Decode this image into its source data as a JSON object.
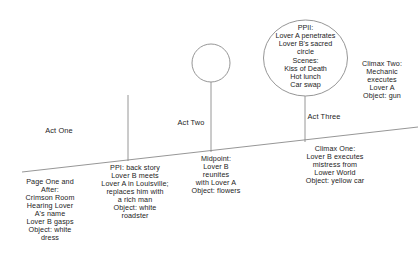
{
  "diagram": {
    "type": "story-structure-beat-sheet",
    "stroke_color": "#8a8a8a",
    "text_color": "#1c1c1c",
    "act_labels": [
      {
        "id": "act-one",
        "text": "Act One"
      },
      {
        "id": "act-two",
        "text": "Act Two"
      },
      {
        "id": "act-three",
        "text": "Act Three"
      }
    ],
    "nodes": {
      "ppii": {
        "shape": "ellipse",
        "text": "PPII:\nLover A penetrates\nLover B's sacred\ncircle\nScenes:\nKiss of Death\nHot lunch\nCar swap"
      },
      "midpoint_circle": {
        "shape": "circle",
        "text": ""
      }
    },
    "beats": [
      {
        "id": "page-one-and-after",
        "text": "Page One and\nAfter:\nCrimson Room\nHearing Lover\nA's name\nLover B gasps\nObject: white\ndress"
      },
      {
        "id": "ppi",
        "text": "PPI: back story\nLover B meets\nLover A in Louisville;\nreplaces him with\na rich man\nObject: white\nroadster"
      },
      {
        "id": "midpoint",
        "text": "Midpoint:\nLover B\nreunites\nwith Lover A\nObject: flowers"
      },
      {
        "id": "climax-one",
        "text": "Climax One:\nLover B executes\nmistress from\nLower World\nObject: yellow car"
      },
      {
        "id": "climax-two",
        "text": "Climax Two:\nMechanic\nexecutes\nLover A\nObject: gun"
      }
    ]
  }
}
